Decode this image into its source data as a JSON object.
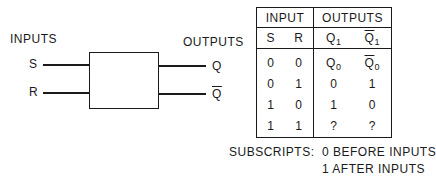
{
  "diagram": {
    "inputs_label": "INPUTS",
    "outputs_label": "OUTPUTS",
    "input_pins": [
      "S",
      "R"
    ],
    "output_pins": [
      {
        "label": "Q",
        "overline": false
      },
      {
        "label": "Q",
        "overline": true
      }
    ]
  },
  "table": {
    "group_headers": [
      "INPUT",
      "OUTPUTS"
    ],
    "column_headers": [
      {
        "label": "S"
      },
      {
        "label": "R"
      },
      {
        "label": "Q",
        "sub": "1",
        "overline": false
      },
      {
        "label": "Q",
        "sub": "1",
        "overline": true
      }
    ],
    "rows": [
      {
        "s": "0",
        "r": "0",
        "q": "Q",
        "q_sub": "0",
        "qbar": "Q",
        "qbar_sub": "0"
      },
      {
        "s": "0",
        "r": "1",
        "q": "0",
        "qbar": "1"
      },
      {
        "s": "1",
        "r": "0",
        "q": "1",
        "qbar": "0"
      },
      {
        "s": "1",
        "r": "1",
        "q": "?",
        "qbar": "?"
      }
    ]
  },
  "notes": {
    "label": "SUBSCRIPTS:",
    "line1": "0 BEFORE INPUTS",
    "line2": "1 AFTER INPUTS"
  }
}
